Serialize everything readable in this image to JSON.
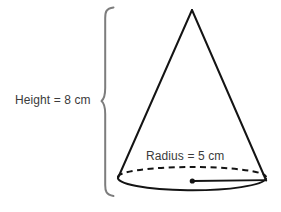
{
  "figure": {
    "type": "geometry-diagram",
    "shape": "cone",
    "background_color": "#ffffff",
    "stroke_color": "#1a1a1a",
    "brace_color": "#7d7d7d",
    "text_color": "#3b3b3b",
    "labels": {
      "height": "Height = 8 cm",
      "radius": "Radius = 5 cm"
    },
    "measurements": {
      "height_value": "8",
      "height_unit": "cm",
      "radius_value": "5",
      "radius_unit": "cm"
    },
    "annotations": {
      "height_brace_name": "height-brace",
      "radius_segment_name": "radius-segment",
      "center_point_name": "base-center-point",
      "hidden_edge_style": "dashed",
      "visible_edge_style": "solid"
    },
    "geometry": {
      "apex_x": 192,
      "apex_y": 10,
      "base_center_x": 192,
      "base_center_y": 177,
      "base_rx": 74,
      "base_ry": 11
    }
  }
}
